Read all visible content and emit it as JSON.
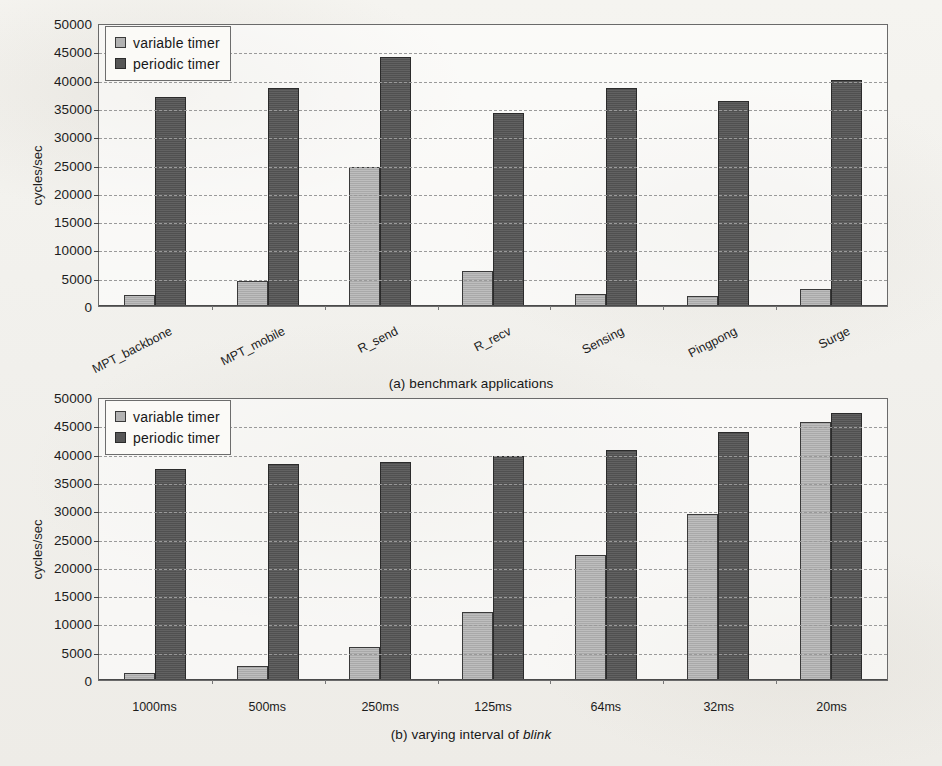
{
  "figure": {
    "background_color": "#f3f2ee",
    "series_colors": {
      "variable_timer": "#b2b2b2",
      "periodic_timer": "#565656"
    },
    "grid_color": "#9a9a9a",
    "axis_color": "#4a4a4a"
  },
  "legend": {
    "variable_label": "variable timer",
    "periodic_label": "periodic timer",
    "position": "top-left inside plot"
  },
  "panel_a": {
    "caption_prefix": "(a) benchmark applications",
    "ylabel": "cycles/sec"
  },
  "panel_b": {
    "caption_prefix": "(b) varying interval of ",
    "caption_italic": "blink",
    "ylabel": "cycles/sec"
  },
  "yaxis": {
    "ticks": [
      "50000",
      "45000",
      "40000",
      "35000",
      "30000",
      "25000",
      "20000",
      "15000",
      "10000",
      "5000",
      "0"
    ],
    "min": 0,
    "max": 50000,
    "step": 5000
  },
  "chart_data": [
    {
      "type": "bar",
      "title": "(a) benchmark applications",
      "xlabel": "",
      "ylabel": "cycles/sec",
      "ylim": [
        0,
        50000
      ],
      "ytick_step": 5000,
      "grid": true,
      "legend_position": "upper left",
      "categories": [
        "MPT_backbone",
        "MPT_mobile",
        "R_send",
        "R_recv",
        "Sensing",
        "Pingpong",
        "Surge"
      ],
      "series": [
        {
          "name": "variable timer",
          "color": "#b2b2b2",
          "values": [
            2000,
            4500,
            24500,
            6100,
            2200,
            1800,
            3000
          ]
        },
        {
          "name": "periodic timer",
          "color": "#565656",
          "values": [
            37000,
            38500,
            44000,
            34100,
            38500,
            36300,
            39900
          ]
        }
      ]
    },
    {
      "type": "bar",
      "title": "(b) varying interval of blink",
      "xlabel": "",
      "ylabel": "cycles/sec",
      "ylim": [
        0,
        50000
      ],
      "ytick_step": 5000,
      "grid": true,
      "legend_position": "upper left",
      "categories": [
        "1000ms",
        "500ms",
        "250ms",
        "125ms",
        "64ms",
        "32ms",
        "20ms"
      ],
      "series": [
        {
          "name": "variable timer",
          "color": "#b2b2b2",
          "values": [
            1300,
            2400,
            5800,
            12000,
            22000,
            29400,
            45500
          ]
        },
        {
          "name": "periodic timer",
          "color": "#565656",
          "values": [
            37200,
            38200,
            38500,
            39500,
            40700,
            43800,
            47200
          ]
        }
      ]
    }
  ]
}
